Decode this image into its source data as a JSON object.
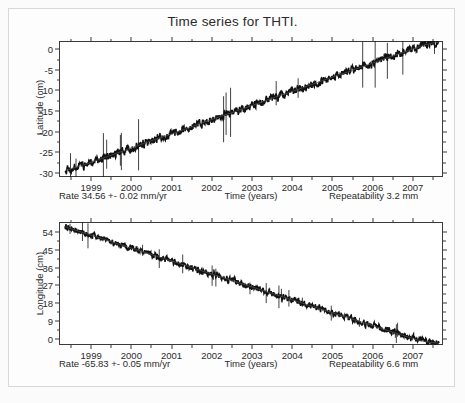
{
  "figure": {
    "title": "Time series for THTI.",
    "station": "THTI",
    "background_color": "#fdfdfd",
    "trace_color": "#111111",
    "axis_color": "#3a3a3a"
  },
  "chart_data": [
    {
      "type": "line",
      "panel": "latitude",
      "title": "Time series for THTI.",
      "xlabel": "Time (years)",
      "ylabel": "Latitude (cm)",
      "xlim": [
        1998.2,
        2007.75
      ],
      "ylim": [
        -31.0,
        2.0
      ],
      "xticks": [
        1999,
        2000,
        2001,
        2002,
        2003,
        2004,
        2005,
        2006,
        2007
      ],
      "xtick_labels": [
        "1999",
        "2000",
        "2001",
        "2002",
        "2003",
        "2004",
        "2005",
        "2006",
        "2007"
      ],
      "yticks": [
        0,
        -5,
        -10,
        -15,
        -20,
        -25,
        -30
      ],
      "ytick_labels": [
        "0",
        "-5",
        "-10",
        "-15",
        "-20",
        "-25",
        "-30"
      ],
      "grid": false,
      "legend": "none",
      "rate_text": "Rate 34.56 +- 0.02 mm/yr",
      "rate_value": 34.56,
      "rate_uncertainty": 0.02,
      "rate_units": "mm/yr",
      "repeatability_text": "Repeatability 3.2 mm",
      "repeatability_value": 3.2,
      "repeatability_units": "mm",
      "x": [
        1998.35,
        1998.5,
        1998.7,
        1998.9,
        1999.1,
        1999.3,
        1999.5,
        1999.7,
        1999.9,
        2000.1,
        2000.3,
        2000.5,
        2000.7,
        2000.9,
        2001.1,
        2001.3,
        2001.5,
        2001.7,
        2001.9,
        2002.1,
        2002.3,
        2002.5,
        2002.7,
        2002.9,
        2003.1,
        2003.3,
        2003.5,
        2003.7,
        2003.9,
        2004.1,
        2004.3,
        2004.5,
        2004.7,
        2004.9,
        2005.1,
        2005.3,
        2005.5,
        2005.7,
        2005.9,
        2006.1,
        2006.3,
        2006.5,
        2006.7,
        2006.9,
        2007.1,
        2007.3,
        2007.5,
        2007.65
      ],
      "y": [
        -29.4,
        -29.0,
        -28.4,
        -27.8,
        -27.1,
        -26.4,
        -25.7,
        -25.0,
        -24.3,
        -23.6,
        -22.9,
        -22.2,
        -21.5,
        -20.9,
        -20.2,
        -19.5,
        -18.8,
        -18.1,
        -17.4,
        -16.7,
        -16.0,
        -15.4,
        -14.7,
        -14.0,
        -13.3,
        -12.6,
        -11.9,
        -11.2,
        -10.6,
        -9.9,
        -9.2,
        -8.5,
        -7.8,
        -7.1,
        -6.4,
        -5.8,
        -5.1,
        -4.4,
        -3.7,
        -3.0,
        -2.3,
        -1.6,
        -1.0,
        -0.3,
        0.4,
        1.1,
        1.5,
        1.7
      ]
    },
    {
      "type": "line",
      "panel": "longitude",
      "xlabel": "Time (years)",
      "ylabel": "Longitude (cm)",
      "xlim": [
        1998.2,
        2007.75
      ],
      "ylim": [
        -3.0,
        59.0
      ],
      "xticks": [
        1999,
        2000,
        2001,
        2002,
        2003,
        2004,
        2005,
        2006,
        2007
      ],
      "xtick_labels": [
        "1999",
        "2000",
        "2001",
        "2002",
        "2003",
        "2004",
        "2005",
        "2006",
        "2007"
      ],
      "yticks": [
        0,
        9,
        18,
        27,
        36,
        45,
        54
      ],
      "ytick_labels": [
        "0",
        "9",
        "18",
        "27",
        "36",
        "45",
        "54"
      ],
      "grid": false,
      "legend": "none",
      "rate_text": "Rate -65.83 +- 0.05 mm/yr",
      "rate_value": -65.83,
      "rate_uncertainty": 0.05,
      "rate_units": "mm/yr",
      "repeatability_text": "Repeatability 6.6 mm",
      "repeatability_value": 6.6,
      "repeatability_units": "mm",
      "x": [
        1998.35,
        1998.5,
        1998.7,
        1998.9,
        1999.1,
        1999.3,
        1999.5,
        1999.7,
        1999.9,
        2000.1,
        2000.3,
        2000.5,
        2000.7,
        2000.9,
        2001.1,
        2001.3,
        2001.5,
        2001.7,
        2001.9,
        2002.1,
        2002.3,
        2002.5,
        2002.7,
        2002.9,
        2003.1,
        2003.3,
        2003.5,
        2003.7,
        2003.9,
        2004.1,
        2004.3,
        2004.5,
        2004.7,
        2004.9,
        2005.1,
        2005.3,
        2005.5,
        2005.7,
        2005.9,
        2006.1,
        2006.3,
        2006.5,
        2006.7,
        2006.9,
        2007.1,
        2007.3,
        2007.5,
        2007.65
      ],
      "y": [
        56.6,
        55.6,
        54.3,
        53.0,
        51.7,
        50.4,
        49.1,
        47.8,
        46.5,
        45.2,
        43.9,
        42.6,
        41.3,
        40.0,
        38.7,
        37.4,
        36.0,
        34.7,
        33.4,
        32.1,
        30.8,
        29.5,
        28.2,
        26.9,
        25.6,
        24.3,
        23.0,
        21.7,
        20.4,
        19.1,
        17.8,
        16.5,
        15.2,
        13.9,
        12.6,
        11.3,
        10.0,
        8.7,
        7.4,
        6.1,
        4.8,
        3.5,
        2.2,
        0.9,
        -0.4,
        -1.2,
        -1.8,
        -2.1
      ]
    }
  ]
}
